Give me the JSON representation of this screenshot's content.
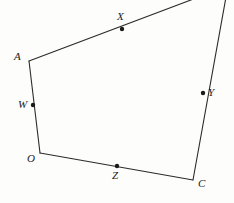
{
  "figure": {
    "kind": "geometry-diagram",
    "stroke_color": "#2b2b2b",
    "dot_color": "#1a1a1a",
    "background_color": "#fdfdfc",
    "stroke_width": 1.1,
    "dot_radius": 2.2,
    "canvas": {
      "width": 234,
      "height": 203
    },
    "vertices": [
      {
        "id": "A",
        "label": "A",
        "x": 29,
        "y": 61,
        "label_x": 14,
        "label_y": 51
      },
      {
        "id": "O",
        "label": "O",
        "x": 40,
        "y": 153,
        "label_x": 27,
        "label_y": 153
      },
      {
        "id": "C",
        "label": "C",
        "x": 193,
        "y": 180,
        "label_x": 198,
        "label_y": 178
      },
      {
        "id": "T",
        "label": "",
        "x": 228,
        "y": -14,
        "label_x": 0,
        "label_y": 0
      }
    ],
    "edges": [
      {
        "id": "A-T",
        "from": "A",
        "to": "T"
      },
      {
        "id": "T-C",
        "from": "T",
        "to": "C"
      },
      {
        "id": "C-O",
        "from": "C",
        "to": "O"
      },
      {
        "id": "O-A",
        "from": "O",
        "to": "A"
      }
    ],
    "points": [
      {
        "id": "X",
        "label": "X",
        "on_edge": "A-T",
        "x": 122,
        "y": 29,
        "label_x": 117,
        "label_y": 11
      },
      {
        "id": "Y",
        "label": "Y",
        "on_edge": "T-C",
        "x": 203,
        "y": 93,
        "label_x": 208,
        "label_y": 87
      },
      {
        "id": "Z",
        "label": "Z",
        "on_edge": "C-O",
        "x": 117,
        "y": 166,
        "label_x": 112,
        "label_y": 170
      },
      {
        "id": "W",
        "label": "W",
        "on_edge": "O-A",
        "x": 33,
        "y": 105,
        "label_x": 18,
        "label_y": 99
      }
    ]
  }
}
